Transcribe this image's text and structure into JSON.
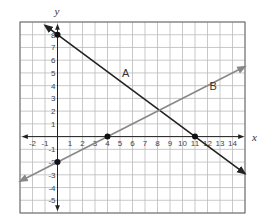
{
  "chart_data": {
    "type": "line",
    "title": "",
    "xlabel": "x",
    "ylabel": "y",
    "xlim": [
      -3,
      15
    ],
    "ylim": [
      -6,
      9
    ],
    "grid": true,
    "legend": "none",
    "x_ticks": [
      -2,
      -1,
      1,
      2,
      3,
      4,
      5,
      6,
      7,
      8,
      9,
      10,
      11,
      12,
      13,
      14
    ],
    "y_ticks": [
      -5,
      -4,
      -3,
      -2,
      -1,
      1,
      2,
      3,
      4,
      5,
      6,
      7,
      8
    ],
    "series": [
      {
        "name": "A",
        "color": "#222222",
        "points": [
          [
            0,
            8
          ],
          [
            11,
            0
          ]
        ],
        "equation": "y = -8/11 x + 8",
        "marked_points": [
          [
            0,
            8
          ],
          [
            11,
            0
          ]
        ],
        "extent": [
          [
            -1,
            8.73
          ],
          [
            15,
            -2.91
          ]
        ]
      },
      {
        "name": "B",
        "color": "#888888",
        "points": [
          [
            0,
            -2
          ],
          [
            4,
            0
          ]
        ],
        "equation": "y = 1/2 x - 2",
        "marked_points": [
          [
            0,
            -2
          ],
          [
            4,
            0
          ]
        ],
        "extent": [
          [
            -3,
            -3.5
          ],
          [
            15,
            5.5
          ]
        ]
      }
    ],
    "annotations": [
      {
        "text": "A",
        "x": 5,
        "y": 5
      },
      {
        "text": "B",
        "x": 12,
        "y": 4
      }
    ]
  }
}
